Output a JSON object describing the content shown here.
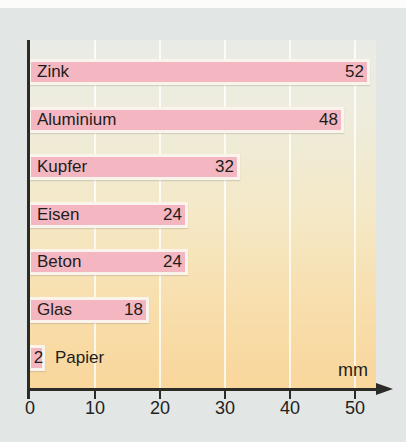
{
  "chart_data": {
    "type": "bar",
    "orientation": "horizontal",
    "categories": [
      "Zink",
      "Aluminium",
      "Kupfer",
      "Eisen",
      "Beton",
      "Glas",
      "Papier"
    ],
    "values": [
      52,
      48,
      32,
      24,
      24,
      18,
      2
    ],
    "title": "",
    "xlabel": "mm",
    "ylabel": "",
    "xlim": [
      0,
      55
    ],
    "xticks": [
      0,
      10,
      20,
      30,
      40,
      50
    ],
    "grid": "vertical white gridlines",
    "legend": "none",
    "colors": {
      "bar_fill": "#f4b7c1",
      "bar_outline": "#faf4ec",
      "axis": "#2b2b28",
      "text": "#1d1d1b",
      "plot_background_top": "#e9ece6",
      "plot_background_bottom": "#f9d69b",
      "page_background": "#e2e7e5"
    }
  }
}
